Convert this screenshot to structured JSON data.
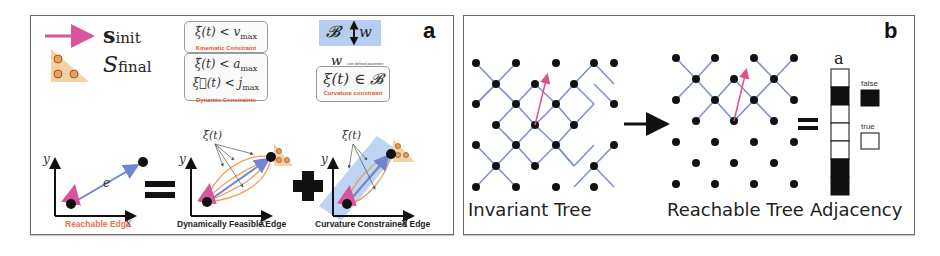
{
  "panel_a": {
    "label": "a",
    "legend": {
      "init_symbol": "s",
      "init_sub": "init",
      "final_symbol": "S",
      "final_sub": "final"
    },
    "constraints": {
      "kinematic_expr": "ξ̇(t) < v",
      "kinematic_sub": "max",
      "kinematic_label": "Kinematic Constraint",
      "dynamic_expr1": "ξ̈(t) < a",
      "dynamic_sub1": "max",
      "dynamic_expr2": "ξ⃛(t) < j",
      "dynamic_sub2": "max",
      "dynamic_label": "Dynamic Constraints",
      "band_symbol": "𝓑",
      "band_width_symbol": "w",
      "w_note_symbol": "w",
      "w_note_text": "user defined parameter",
      "curvature_expr": "ξ(t) ∈ 𝓑",
      "curvature_label": "Curvature constraint"
    },
    "plots": [
      {
        "caption": "Reachable Edge",
        "x_label": "x",
        "y_label": "y",
        "edge_label": "e",
        "caption_color": "#e8734f"
      },
      {
        "caption": "Dynamically Feasible Edge",
        "x_label": "x",
        "y_label": "y",
        "traj_label": "ξ(t)",
        "caption_color": "#222222"
      },
      {
        "caption": "Curvature Constrained Edge",
        "x_label": "x",
        "y_label": "y",
        "traj_label": "ξ(t)",
        "caption_color": "#222222"
      }
    ],
    "operators": [
      "=",
      "+"
    ]
  },
  "panel_b": {
    "label": "b",
    "invariant_caption": "Invariant Tree",
    "reachable_caption": "Reachable Tree",
    "adjacency_caption": "Adjacency",
    "adjacency_header": "a",
    "adjacency_cells": [
      true,
      false,
      true,
      true,
      true,
      false,
      false
    ],
    "legend_false": "false",
    "legend_true": "true",
    "operator": "="
  },
  "colors": {
    "edge_blue": "#6f86d6",
    "init_pink": "#d9559b",
    "traj_orange": "#f0a050",
    "band_blue": "#a9c4ee",
    "goal_tan": "#f3d2a8",
    "red_label": "#e0563a",
    "node_black": "#111111"
  }
}
